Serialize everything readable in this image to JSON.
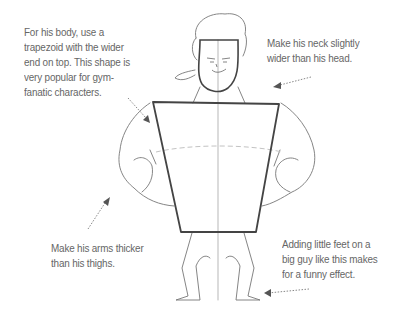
{
  "illustration": {
    "subject": "cartoon-muscle-man-body-construction",
    "line_color": "#555555",
    "text_color": "#666666"
  },
  "captions": {
    "body_shape": [
      "For his body, use a",
      "trapezoid with the wider",
      "end on top. This shape is",
      "very popular for gym-",
      "fanatic characters."
    ],
    "neck": [
      "Make his neck slightly",
      "wider than his head."
    ],
    "arms": [
      "Make his arms thicker",
      "than his thighs."
    ],
    "feet": [
      "Adding little feet on a",
      "big guy like this makes",
      "for a funny effect."
    ]
  }
}
